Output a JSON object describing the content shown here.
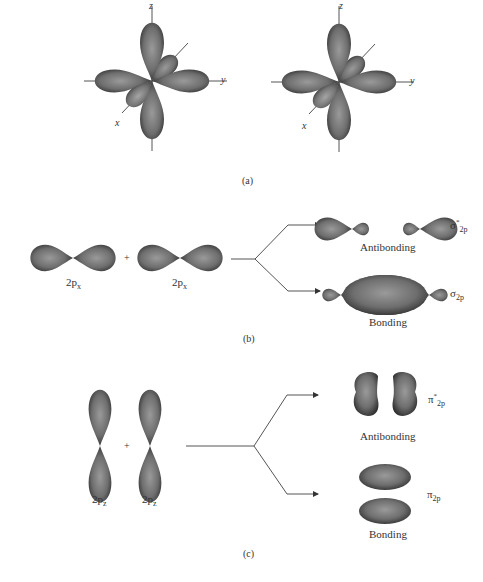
{
  "figure": {
    "panel_a": {
      "label": "(a)",
      "diagrams": [
        {
          "axes": {
            "z": "z",
            "y": "y",
            "x": "x"
          }
        },
        {
          "axes": {
            "z": "z",
            "y": "y",
            "x": "x"
          }
        }
      ]
    },
    "panel_b": {
      "label": "(b)",
      "inputs": [
        {
          "orbital": "2p",
          "subscript": "x"
        },
        {
          "orbital": "2p",
          "subscript": "x"
        }
      ],
      "operator": "+",
      "outputs": [
        {
          "type": "Antibonding",
          "symbol": "σ",
          "subscript": "2p",
          "superscript": "*"
        },
        {
          "type": "Bonding",
          "symbol": "σ",
          "subscript": "2p",
          "superscript": ""
        }
      ]
    },
    "panel_c": {
      "label": "(c)",
      "inputs": [
        {
          "orbital": "2p",
          "subscript": "z"
        },
        {
          "orbital": "2p",
          "subscript": "z"
        }
      ],
      "operator": "+",
      "outputs": [
        {
          "type": "Antibonding",
          "symbol": "π",
          "subscript": "2p",
          "superscript": "*"
        },
        {
          "type": "Bonding",
          "symbol": "π",
          "subscript": "2p",
          "superscript": ""
        }
      ]
    }
  },
  "colors": {
    "lobe_dark": "#3a3a3a",
    "lobe_mid": "#6e6e6e",
    "lobe_light": "#9a9a9a",
    "line": "#555555"
  }
}
